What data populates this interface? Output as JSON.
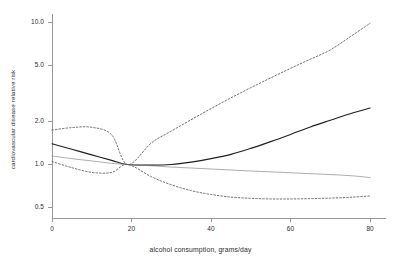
{
  "chart_data": {
    "type": "line",
    "title": "",
    "xlabel": "alcohol consumption, grams/day",
    "ylabel": "cardiovascular disease relative risk",
    "xlim": [
      0,
      84
    ],
    "ylim": [
      0.42,
      11.5
    ],
    "yscale": "log",
    "xticks": [
      0,
      20,
      40,
      60,
      80
    ],
    "xtick_labels": [
      "0",
      "20",
      "40",
      "60",
      "80"
    ],
    "yticks": [
      0.5,
      1.0,
      2.0,
      5.0,
      10.0
    ],
    "ytick_labels": [
      "0.5",
      "1.0",
      "2.0",
      "5.0",
      "10.0"
    ],
    "grid": false,
    "legend": "none",
    "reference_point": {
      "x": 19,
      "y": 1.0
    },
    "series": [
      {
        "name": "upper confidence limit (model A)",
        "style": "dashed",
        "color": "#555555",
        "x": [
          0,
          5,
          10,
          15,
          19,
          25,
          30,
          35,
          40,
          45,
          50,
          55,
          60,
          65,
          70,
          75,
          80
        ],
        "values": [
          1.75,
          1.82,
          1.83,
          1.62,
          1.0,
          1.42,
          1.72,
          2.07,
          2.48,
          2.95,
          3.48,
          4.08,
          4.76,
          5.53,
          6.42,
          7.95,
          9.9
        ]
      },
      {
        "name": "pooled relative risk (model A)",
        "style": "solid",
        "color": "#1f1f1f",
        "x": [
          0,
          5,
          10,
          15,
          19,
          25,
          30,
          35,
          40,
          45,
          50,
          55,
          60,
          65,
          70,
          75,
          80
        ],
        "values": [
          1.4,
          1.28,
          1.17,
          1.07,
          1.0,
          0.99,
          1.0,
          1.04,
          1.1,
          1.18,
          1.3,
          1.45,
          1.63,
          1.84,
          2.05,
          2.28,
          2.5
        ]
      },
      {
        "name": "pooled relative risk (model B)",
        "style": "solid-thin",
        "color": "#8a8a8a",
        "x": [
          0,
          5,
          10,
          15,
          19,
          25,
          30,
          35,
          40,
          45,
          50,
          55,
          60,
          65,
          70,
          75,
          80
        ],
        "values": [
          1.15,
          1.1,
          1.06,
          1.02,
          1.0,
          0.98,
          0.96,
          0.945,
          0.93,
          0.915,
          0.9,
          0.888,
          0.875,
          0.862,
          0.85,
          0.835,
          0.81
        ]
      },
      {
        "name": "lower confidence limit (model A)",
        "style": "dashed",
        "color": "#555555",
        "x": [
          0,
          5,
          10,
          15,
          19,
          25,
          30,
          35,
          40,
          45,
          50,
          55,
          60,
          65,
          70,
          75,
          80
        ],
        "values": [
          1.05,
          0.95,
          0.88,
          0.88,
          1.0,
          0.82,
          0.72,
          0.655,
          0.615,
          0.59,
          0.578,
          0.572,
          0.572,
          0.575,
          0.58,
          0.588,
          0.6
        ]
      }
    ]
  },
  "axis": {
    "frame_color": "#8c8c8c",
    "tick_color": "#8c8c8c"
  }
}
